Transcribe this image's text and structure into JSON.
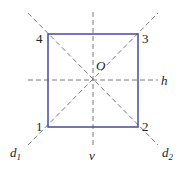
{
  "diagram": {
    "square": {
      "stroke": "#4a4a9a",
      "corners": [
        {
          "label": "1",
          "x": 48,
          "y": 127
        },
        {
          "label": "2",
          "x": 138,
          "y": 127
        },
        {
          "label": "3",
          "x": 138,
          "y": 34
        },
        {
          "label": "4",
          "x": 48,
          "y": 34
        }
      ]
    },
    "center": {
      "label": "O",
      "x": 93,
      "y": 80
    },
    "axes": [
      {
        "name": "h",
        "label": "h"
      },
      {
        "name": "v",
        "label": "v"
      },
      {
        "name": "d1",
        "label": "d",
        "sub": "1"
      },
      {
        "name": "d2",
        "label": "d",
        "sub": "2"
      }
    ],
    "axis_color": "#777777"
  }
}
